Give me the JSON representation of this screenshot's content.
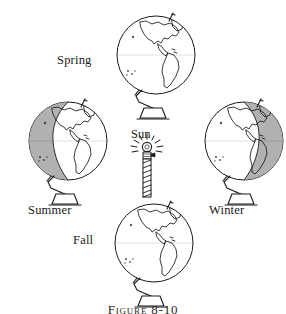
{
  "figure": {
    "caption": "Figure 8-10",
    "background_color": "#ffffff",
    "ink_color": "#1a1a1a",
    "shade_color": "#a8a8a8"
  },
  "sun": {
    "label": "Sun",
    "icon": "light-bulb-lamp-icon"
  },
  "globes": [
    {
      "id": "spring",
      "label": "Spring",
      "position": "top",
      "lit_state": "fully-lit",
      "shaded_side": "none",
      "continents": "north-and-south-america"
    },
    {
      "id": "summer",
      "label": "Summer",
      "position": "left",
      "lit_state": "partially-shaded",
      "shaded_side": "left",
      "continents": "north-and-south-america"
    },
    {
      "id": "winter",
      "label": "Winter",
      "position": "right",
      "lit_state": "partially-shaded",
      "shaded_side": "right",
      "continents": "north-and-south-america"
    },
    {
      "id": "fall",
      "label": "Fall",
      "position": "bottom",
      "lit_state": "fully-lit",
      "shaded_side": "none",
      "continents": "north-and-south-america"
    }
  ]
}
